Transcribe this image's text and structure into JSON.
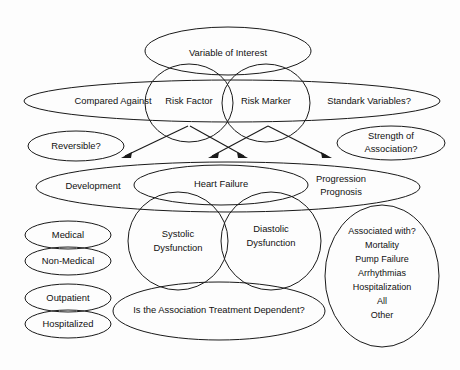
{
  "diagram": {
    "type": "venn-ellipse-diagram",
    "background_color": "#fdfdfd",
    "stroke_color": "#1a1a1a",
    "text_color": "#111111",
    "nodes": {
      "variable_of_interest": {
        "label": "Variable of Interest"
      },
      "compared_against_band": {
        "label_left": "Compared Against",
        "label_right": "Standark Variables?"
      },
      "risk_factor": {
        "label": "Risk Factor"
      },
      "risk_marker": {
        "label": "Risk Marker"
      },
      "reversible": {
        "label": "Reversible?"
      },
      "strength_of_association": {
        "line1": "Strength of",
        "line2": "Association?"
      },
      "outcome_band": {
        "label_left": "Development",
        "label_right_line1": "Progression",
        "label_right_line2": "Prognosis"
      },
      "heart_failure": {
        "label": "Heart Failure"
      },
      "systolic_dysfunction": {
        "line1": "Systolic",
        "line2": "Dysfunction"
      },
      "diastolic_dysfunction": {
        "line1": "Diastolic",
        "line2": "Dysfunction"
      },
      "medical": {
        "label": "Medical"
      },
      "non_medical": {
        "label": "Non-Medical"
      },
      "outpatient": {
        "label": "Outpatient"
      },
      "hospitalized": {
        "label": "Hospitalized"
      },
      "treatment_dependent": {
        "label": "Is the Association Treatment Dependent?"
      },
      "associated_with": {
        "heading": "Associated with?",
        "items": [
          "Mortality",
          "Pump Failure",
          "Arrhythmias",
          "Hospitalization",
          "All",
          "Other"
        ]
      }
    },
    "arrows": [
      {
        "name": "arrow-risk-factor-to-development",
        "from_label": "Risk Factor",
        "to_label": "Development"
      },
      {
        "name": "arrow-risk-factor-to-heart-failure",
        "from_label": "Risk Factor",
        "to_label": "Heart Failure"
      },
      {
        "name": "arrow-risk-marker-to-heart-failure",
        "from_label": "Risk Marker",
        "to_label": "Heart Failure"
      },
      {
        "name": "arrow-risk-marker-to-progression",
        "from_label": "Risk Marker",
        "to_label": "Progression Prognosis"
      }
    ]
  }
}
